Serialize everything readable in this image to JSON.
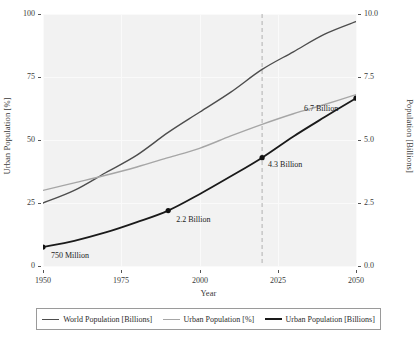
{
  "chart_data": {
    "type": "line",
    "title": "",
    "xlabel": "Year",
    "ylabel": "Urban Population [%]",
    "ylabel_right": "Population [Billions]",
    "xlim": [
      1950,
      2050
    ],
    "ylim": [
      0,
      100
    ],
    "ylim_right": [
      0.0,
      10.0
    ],
    "grid": true,
    "legend_position": "below",
    "xticks": [
      "1950",
      "1975",
      "2000",
      "2025",
      "2050"
    ],
    "xtick_values": [
      1950,
      1975,
      2000,
      2025,
      2050
    ],
    "yticks_left": [
      "100",
      "75",
      "50",
      "25",
      "0"
    ],
    "ytick_values_left": [
      100,
      75,
      50,
      25,
      0
    ],
    "yticks_right": [
      "10.0",
      "7.5",
      "5.0",
      "2.5",
      "0.0"
    ],
    "ytick_values_right": [
      10.0,
      7.5,
      5.0,
      2.5,
      0.0
    ],
    "x": [
      1950,
      1960,
      1970,
      1980,
      1990,
      2000,
      2010,
      2020,
      2030,
      2040,
      2050
    ],
    "series": [
      {
        "name": "World Population [Billions]",
        "axis": "right",
        "color": "#4d4d4d",
        "width": 1.4,
        "values": [
          2.5,
          3.0,
          3.7,
          4.4,
          5.3,
          6.1,
          6.9,
          7.8,
          8.5,
          9.2,
          9.7
        ]
      },
      {
        "name": "Urban Population [%]",
        "axis": "left",
        "color": "#a6a6a6",
        "width": 1.4,
        "values": [
          30.0,
          33.0,
          36.0,
          39.3,
          43.0,
          46.7,
          51.6,
          56.2,
          60.4,
          64.1,
          68.0
        ]
      },
      {
        "name": "Urban Population [Billions]",
        "axis": "right",
        "color": "#1a1a1a",
        "width": 1.8,
        "values": [
          0.75,
          1.0,
          1.33,
          1.74,
          2.2,
          2.85,
          3.56,
          4.3,
          5.14,
          5.91,
          6.66
        ]
      }
    ],
    "markers": [
      {
        "label": "750 Million",
        "x": 1950,
        "y_right": 0.75,
        "series": "Urban Population [Billions]"
      },
      {
        "label": "2.2 Billion",
        "x": 1990,
        "y_right": 2.2,
        "series": "Urban Population [Billions]"
      },
      {
        "label": "4.3 Billion",
        "x": 2020,
        "y_right": 4.3,
        "series": "Urban Population [Billions]"
      },
      {
        "label": "6.7 Billion",
        "x": 2050,
        "y_right": 6.66,
        "series": "Urban Population [Billions]"
      }
    ],
    "annotations": [
      {
        "text": "750 Million",
        "x": 1950,
        "y_right": 0.75
      },
      {
        "text": "2.2 Billion",
        "x": 1990,
        "y_right": 2.2
      },
      {
        "text": "4.3 Billion",
        "x": 2020,
        "y_right": 4.3
      },
      {
        "text": "6.7 Billion",
        "x": 2050,
        "y_right": 6.66
      }
    ],
    "vline": {
      "x": 2020,
      "style": "dashed",
      "color": "#b0b0b0"
    },
    "legend": [
      {
        "label": "World Population [Billions]",
        "color": "#4d4d4d",
        "width": 1.6
      },
      {
        "label": "Urban Population [%]",
        "color": "#a6a6a6",
        "width": 1.6
      },
      {
        "label": "Urban Population [Billions]",
        "color": "#1a1a1a",
        "width": 2.2
      }
    ],
    "plot_background": "#f2f2f2"
  }
}
